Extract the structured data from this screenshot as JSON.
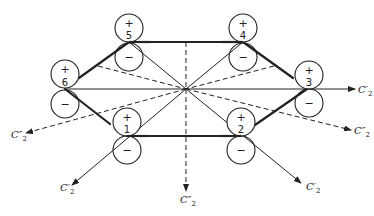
{
  "diagram": {
    "title": "",
    "colors": {
      "ink": "#222222",
      "background": "#ffffff"
    },
    "center": {
      "x": 186,
      "y": 89
    },
    "atoms": [
      {
        "id": "1",
        "number": "1",
        "upper_sign": "+",
        "lower_sign": "−",
        "x": 127,
        "y": 136
      },
      {
        "id": "2",
        "number": "2",
        "upper_sign": "+",
        "lower_sign": "−",
        "x": 241,
        "y": 136
      },
      {
        "id": "3",
        "number": "3",
        "upper_sign": "+",
        "lower_sign": "−",
        "x": 307,
        "y": 89
      },
      {
        "id": "4",
        "number": "4",
        "upper_sign": "+",
        "lower_sign": "−",
        "x": 243,
        "y": 42
      },
      {
        "id": "5",
        "number": "5",
        "upper_sign": "+",
        "lower_sign": "−",
        "x": 129,
        "y": 42
      },
      {
        "id": "6",
        "number": "6",
        "upper_sign": "+",
        "lower_sign": "−",
        "x": 65,
        "y": 89
      }
    ],
    "axes": [
      {
        "id": "c2p-right",
        "type": "C'2",
        "base": "C",
        "prime": "′",
        "sub": "2",
        "style": "solid",
        "label_x": 358,
        "label_y": 93
      },
      {
        "id": "c2pp-right",
        "type": "C''2",
        "base": "C",
        "prime": "″",
        "sub": "2",
        "style": "dashed",
        "label_x": 354,
        "label_y": 134
      },
      {
        "id": "c2p-lower-right",
        "type": "C'2",
        "base": "C",
        "prime": "′",
        "sub": "2",
        "style": "solid",
        "label_x": 306,
        "label_y": 190
      },
      {
        "id": "c2pp-down",
        "type": "C''2",
        "base": "C",
        "prime": "″",
        "sub": "2",
        "style": "dashed",
        "label_x": 180,
        "label_y": 203
      },
      {
        "id": "c2p-lower-left",
        "type": "C'2",
        "base": "C",
        "prime": "′",
        "sub": "2",
        "style": "solid",
        "label_x": 60,
        "label_y": 191
      },
      {
        "id": "c2pp-left",
        "type": "C''2",
        "base": "C",
        "prime": "″",
        "sub": "2",
        "style": "dashed",
        "label_x": 11,
        "label_y": 138
      }
    ]
  }
}
